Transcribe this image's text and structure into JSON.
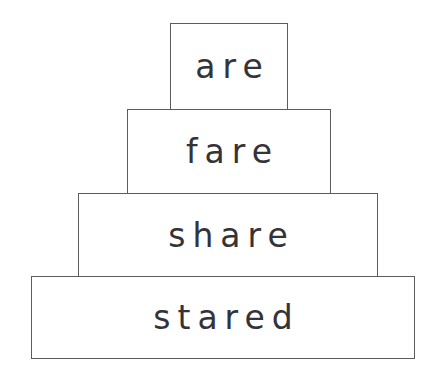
{
  "document": {
    "type": "word-ladder-pyramid",
    "background_color": "#ffffff",
    "box_border_color": "#5c5c5c",
    "box_fill_color": "#ffffff",
    "text_color": "#333338",
    "row_count": 4
  },
  "rows": [
    {
      "index": 1,
      "word": "are",
      "letters": 3,
      "position": "top",
      "box": {
        "x": 170,
        "y": 23,
        "width": 118,
        "height": 87
      }
    },
    {
      "index": 2,
      "word": "fare",
      "letters": 4,
      "position": "second",
      "box": {
        "x": 127,
        "y": 109,
        "width": 204,
        "height": 85
      }
    },
    {
      "index": 3,
      "word": "share",
      "letters": 5,
      "position": "third",
      "box": {
        "x": 78,
        "y": 193,
        "width": 300,
        "height": 84
      }
    },
    {
      "index": 4,
      "word": "stared",
      "letters": 6,
      "position": "bottom",
      "box": {
        "x": 31,
        "y": 276,
        "width": 384,
        "height": 83
      }
    }
  ]
}
